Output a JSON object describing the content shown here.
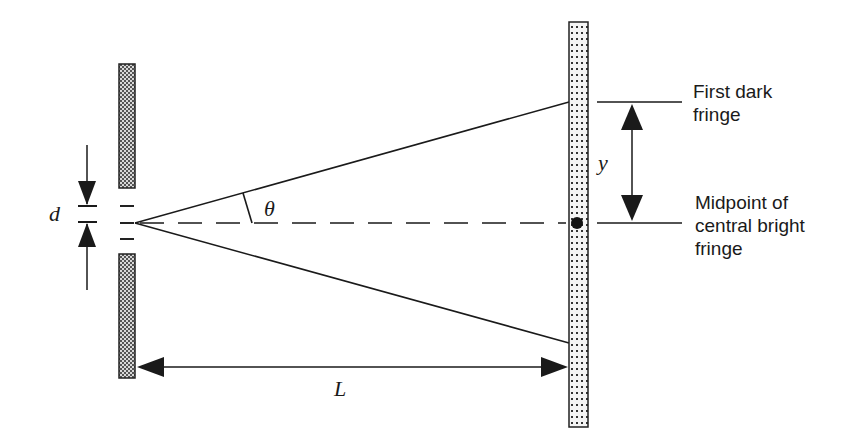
{
  "diagram": {
    "labels": {
      "slit_width": "d",
      "angle": "θ",
      "fringe_offset": "y",
      "distance": "L",
      "first_dark_line1": "First dark",
      "first_dark_line2": "fringe",
      "midpoint_line1": "Midpoint of",
      "midpoint_line2": "central bright",
      "midpoint_line3": "fringe"
    },
    "colors": {
      "ink": "#1a1a1a",
      "barrier_fill": "#9a9a9a",
      "screen_fill": "#f2f2f2",
      "background": "#ffffff"
    },
    "elements": [
      {
        "id": "slit-barrier",
        "kind": "barrier with narrow slit"
      },
      {
        "id": "screen",
        "kind": "dotted viewing screen"
      },
      {
        "id": "upper-ray",
        "kind": "ray to first dark fringe (above)"
      },
      {
        "id": "lower-ray",
        "kind": "ray to first dark fringe (below)"
      },
      {
        "id": "center-axis",
        "kind": "dashed central axis"
      },
      {
        "id": "central-dot",
        "kind": "midpoint of central bright fringe"
      },
      {
        "id": "d-arrows",
        "kind": "slit width dimension"
      },
      {
        "id": "y-arrow",
        "kind": "fringe offset dimension"
      },
      {
        "id": "L-arrow",
        "kind": "slit-to-screen distance"
      }
    ]
  }
}
